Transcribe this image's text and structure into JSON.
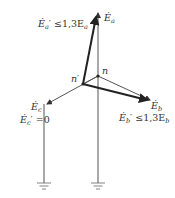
{
  "diagram": {
    "type": "phasor-diagram",
    "labels": {
      "ea": "Ė",
      "ea_sub": "a",
      "ea_prime_main": "Ė",
      "ea_prime_sub": "a",
      "ea_prime_rel": "′ ≤1,3E",
      "ea_prime_rel_sub": "a",
      "eb": "Ė",
      "eb_sub": "b",
      "eb_prime_main": "Ė",
      "eb_prime_sub": "b",
      "eb_prime_rel": "′ ≤1,3E",
      "eb_prime_rel_sub": "b",
      "ec": "Ė",
      "ec_sub": "c",
      "ec_prime_main": "Ė",
      "ec_prime_sub": "c",
      "ec_prime_rel": "′ =0",
      "n": "n",
      "n_prime": "n′"
    },
    "nodes": {
      "n": [
        98,
        76
      ],
      "n_prime": [
        83,
        84
      ]
    },
    "colors": {
      "line": "#555555",
      "thick": "#222222"
    }
  }
}
